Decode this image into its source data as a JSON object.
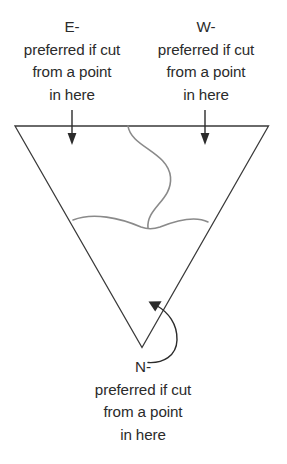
{
  "figure": {
    "type": "region-preference-triangle-diagram",
    "background_color": "#ffffff",
    "triangle_stroke_color": "#3a3a3a",
    "divider_stroke_color": "#8a8a8a",
    "text_color": "#2b2b2b"
  },
  "labels": {
    "east": {
      "heading": "E-",
      "line1": "preferred if cut",
      "line2": "from a point",
      "line3": "in here"
    },
    "west": {
      "heading": "W-",
      "line1": "preferred if cut",
      "line2": "from a point",
      "line3": "in here"
    },
    "north": {
      "heading": "N-",
      "line1": "preferred if cut",
      "line2": "from a point",
      "line3": "in here"
    }
  },
  "annotations": {
    "east_arrow": "down-arrow-icon",
    "west_arrow": "down-arrow-icon",
    "north_arrow": "curved-up-left-arrow-icon"
  }
}
